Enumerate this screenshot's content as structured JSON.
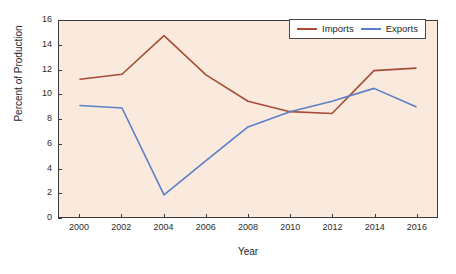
{
  "chart_data": {
    "type": "line",
    "title": "",
    "xlabel": "Year",
    "ylabel": "Percent of Production",
    "x": [
      2000,
      2002,
      2004,
      2006,
      2008,
      2010,
      2012,
      2014,
      2016
    ],
    "xticklabels": [
      "2000",
      "2002",
      "2004",
      "2006",
      "2008",
      "2010",
      "2012",
      "2014",
      "2016"
    ],
    "yticklabels": [
      "0",
      "2",
      "4",
      "6",
      "8",
      "10",
      "12",
      "14",
      "16"
    ],
    "yticks": [
      0,
      2,
      4,
      6,
      8,
      10,
      12,
      14,
      16
    ],
    "xlim": [
      1999,
      2017
    ],
    "ylim": [
      0,
      16
    ],
    "grid": false,
    "legend_position": "top-right",
    "series": [
      {
        "name": "Imports",
        "color": "#a84b35",
        "values": [
          11.25,
          11.65,
          14.8,
          11.6,
          9.45,
          8.6,
          8.45,
          11.95,
          12.15
        ]
      },
      {
        "name": "Exports",
        "color": "#5b7fc7",
        "values": [
          9.1,
          8.9,
          1.8,
          4.6,
          7.35,
          8.6,
          9.45,
          10.5,
          9.0
        ]
      }
    ]
  },
  "figure": {
    "plot_background": "#faeade",
    "page_background": "#ffffff",
    "axis_color": "#3a3a3a"
  }
}
